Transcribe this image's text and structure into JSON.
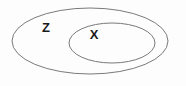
{
  "diagram": {
    "type": "venn-containment",
    "background_color": "#fdfdfd",
    "stroke_color": "#7a7a7a",
    "label_color": "#1a1a1a",
    "stroke_width": 1,
    "width": 186,
    "height": 86,
    "sets": [
      {
        "id": "outer",
        "label": "Z",
        "shape": "ellipse",
        "cx": 90,
        "cy": 41,
        "rx": 78,
        "ry": 33,
        "label_x": 46,
        "label_y": 27
      },
      {
        "id": "inner",
        "label": "X",
        "shape": "ellipse",
        "cx": 112,
        "cy": 43,
        "rx": 43,
        "ry": 20,
        "label_x": 94,
        "label_y": 34
      }
    ]
  }
}
